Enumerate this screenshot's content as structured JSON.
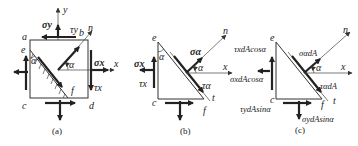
{
  "figure": {
    "panels": [
      {
        "id": "a",
        "caption": "(a)",
        "points": {
          "a": "a",
          "b": "b",
          "c": "c",
          "d": "d",
          "e": "e",
          "f": "f"
        },
        "axes": {
          "x": "x",
          "y": "y",
          "n": "n"
        },
        "angle": "α",
        "stresses": {
          "sigma_y": "σy",
          "tau_y": "τy",
          "sigma_x": "σx",
          "tau_x": "τx"
        }
      },
      {
        "id": "b",
        "caption": "(b)",
        "points": {
          "c": "c",
          "e": "e",
          "f": "f",
          "t": "t"
        },
        "axes": {
          "x": "x",
          "n": "n"
        },
        "angle": "α",
        "stresses": {
          "sigma_alpha": "σα",
          "tau_alpha": "τα",
          "sigma_x": "σx",
          "tau_x": "τx"
        }
      },
      {
        "id": "c",
        "caption": "(c)",
        "points": {
          "c": "c",
          "e": "e",
          "f": "f",
          "t": "t"
        },
        "axes": {
          "x": "x",
          "n": "n"
        },
        "angle": "α",
        "forces": {
          "sigma_alpha_dA": "σαdA",
          "tau_alpha_dA": "ταdA",
          "tau_x_term": "τxdAcosα",
          "sigma_x_term": "σxdAcosα",
          "tau_y_term": "τydAsinα",
          "sigma_y_term": "σydAsinα"
        }
      }
    ]
  }
}
